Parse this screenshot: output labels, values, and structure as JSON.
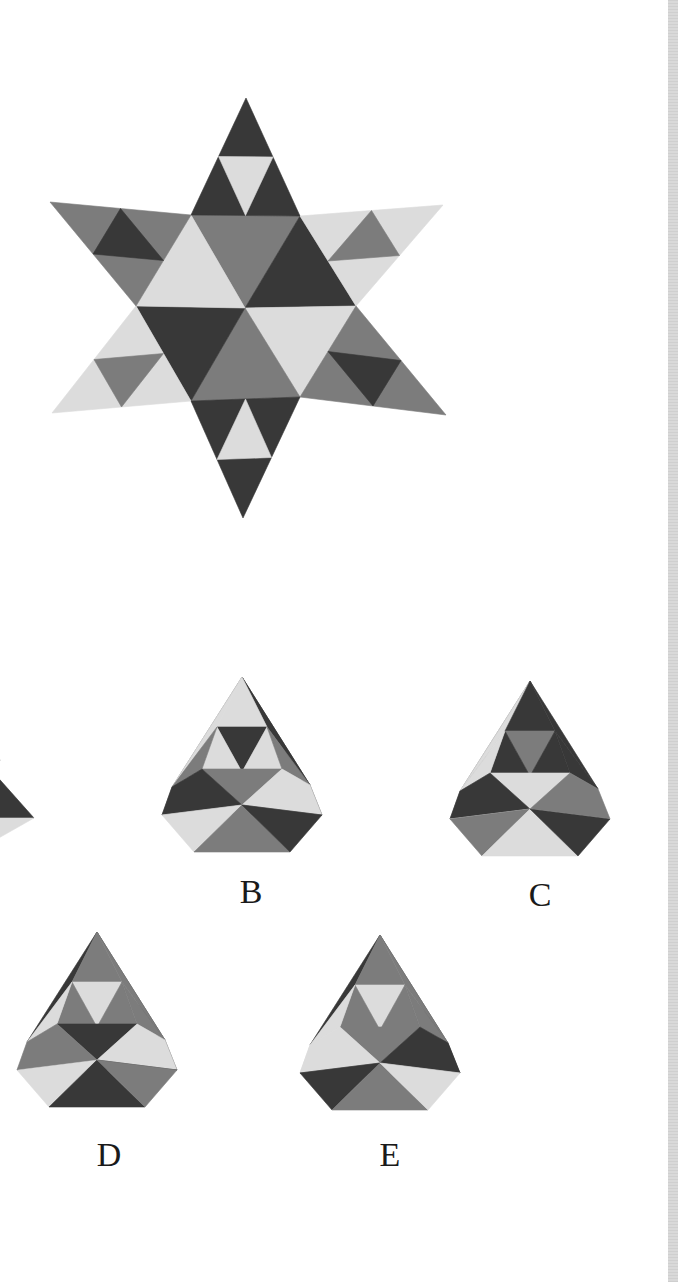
{
  "colors": {
    "dark": "#383838",
    "mid": "#7c7c7c",
    "light": "#dcdcdc",
    "strip": "#d4d4d4",
    "background": "#ffffff"
  },
  "net": {
    "name": "star-net",
    "tips": {
      "top": [
        246,
        98
      ],
      "upper_right": [
        443,
        205
      ],
      "lower_right": [
        446,
        415
      ],
      "bottom": [
        243,
        518
      ],
      "lower_left": [
        52,
        413
      ],
      "upper_left": [
        50,
        202
      ]
    },
    "hexagon": {
      "tl": [
        191,
        215
      ],
      "tr": [
        300,
        216
      ],
      "r": [
        356,
        306
      ],
      "br": [
        300,
        397
      ],
      "bl": [
        191,
        401
      ],
      "l": [
        136,
        306
      ]
    },
    "center": [
      245,
      308
    ]
  },
  "options": [
    {
      "id": "A",
      "label": "",
      "cx": 0,
      "top": 730,
      "partial": true
    },
    {
      "id": "B",
      "label": "B",
      "cx": 242,
      "top": 677,
      "label_x": 251,
      "label_y": 875
    },
    {
      "id": "C",
      "label": "C",
      "cx": 530,
      "top": 681,
      "label_x": 540,
      "label_y": 878
    },
    {
      "id": "D",
      "label": "D",
      "cx": 97,
      "top": 932,
      "label_x": 109,
      "label_y": 1138
    },
    {
      "id": "E",
      "label": "E",
      "cx": 380,
      "top": 935,
      "label_x": 390,
      "label_y": 1138
    }
  ]
}
